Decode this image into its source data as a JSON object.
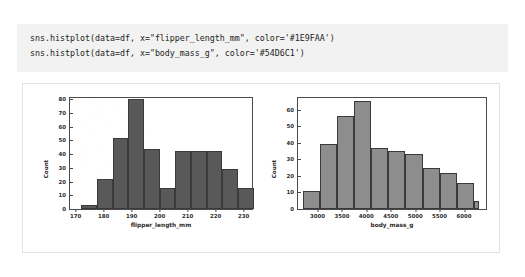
{
  "code_block": {
    "lines": [
      "sns.histplot(data=df, x=\"flipper_length_mm\", color='#1E9FAA')",
      "sns.histplot(data=df, x=\"body_mass_g\", color='#54D6C1')"
    ],
    "background": "#f2f2f2",
    "text_color": "#1c1c1c"
  },
  "colors": {
    "left_bar_fill": "#595959",
    "right_bar_fill": "#8d8d8d",
    "bar_edge": "#3a3a3a",
    "axis": "#4a4a4a",
    "card_border": "#e2e2e2",
    "code_color_1": "#1E9FAA",
    "code_color_2": "#54D6C1"
  },
  "chart_data": [
    {
      "type": "bar",
      "name": "flipper_length_histogram",
      "title": "",
      "xlabel": "flipper_length_mm",
      "ylabel": "Count",
      "xlim": [
        168,
        233
      ],
      "ylim": [
        0,
        81
      ],
      "xticks": [
        170,
        180,
        190,
        200,
        210,
        220,
        230
      ],
      "yticks": [
        0,
        10,
        20,
        30,
        40,
        50,
        60,
        70,
        80
      ],
      "grid": false,
      "legend": null,
      "bin_edges": [
        172,
        177.6,
        183.2,
        188.8,
        194.4,
        200,
        205.6,
        211.2,
        216.8,
        222.4,
        228,
        233.6
      ],
      "values": [
        3,
        22,
        52,
        80,
        44,
        15,
        42,
        42,
        42,
        29,
        15
      ]
    },
    {
      "type": "bar",
      "name": "body_mass_histogram",
      "title": "",
      "xlabel": "body_mass_g",
      "ylabel": "Count",
      "xlim": [
        2600,
        6450
      ],
      "ylim": [
        0,
        67
      ],
      "xticks": [
        3000,
        3500,
        4000,
        4500,
        5000,
        5500,
        6000
      ],
      "yticks": [
        0,
        10,
        20,
        30,
        40,
        50,
        60
      ],
      "grid": false,
      "legend": null,
      "bin_edges": [
        2700,
        3050,
        3400,
        3750,
        4100,
        4450,
        4800,
        5150,
        5500,
        5850,
        6200,
        6300
      ],
      "values": [
        11,
        39,
        56,
        65,
        37,
        35,
        33,
        25,
        22,
        16,
        5
      ]
    }
  ]
}
